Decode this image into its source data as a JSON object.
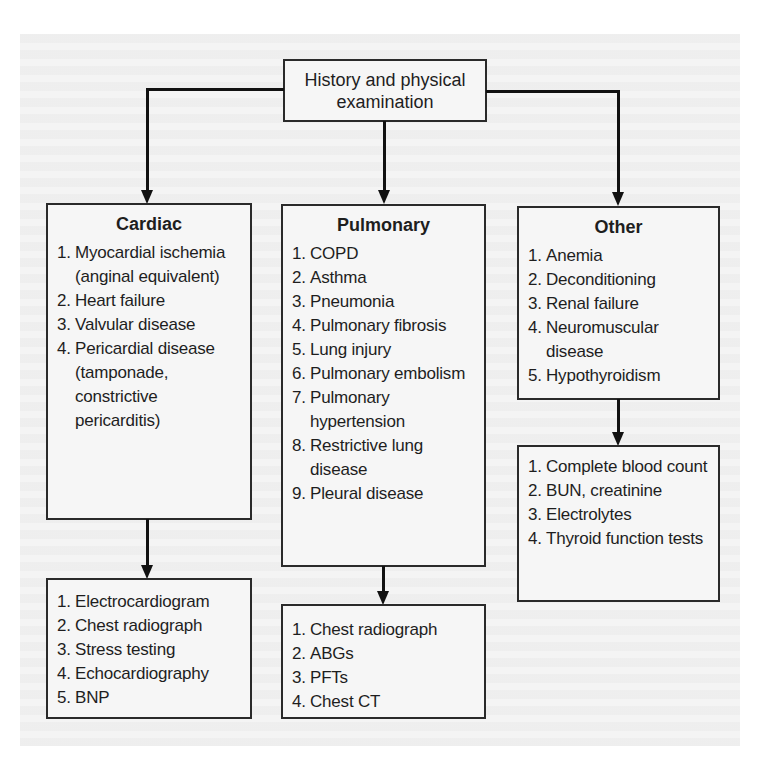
{
  "root": {
    "label_line1": "History and physical",
    "label_line2": "examination"
  },
  "branches": [
    {
      "title": "Cardiac",
      "causes": [
        {
          "n": "1.",
          "text": "Myocardial ischemia (anginal equivalent)"
        },
        {
          "n": "2.",
          "text": "Heart failure"
        },
        {
          "n": "3.",
          "text": "Valvular disease"
        },
        {
          "n": "4.",
          "text": "Pericardial disease (tamponade, constrictive pericarditis)"
        }
      ],
      "tests": [
        {
          "n": "1.",
          "text": "Electrocardiogram"
        },
        {
          "n": "2.",
          "text": "Chest radiograph"
        },
        {
          "n": "3.",
          "text": "Stress testing"
        },
        {
          "n": "4.",
          "text": "Echocardiography"
        },
        {
          "n": "5.",
          "text": "BNP"
        }
      ]
    },
    {
      "title": "Pulmonary",
      "causes": [
        {
          "n": "1.",
          "text": "COPD"
        },
        {
          "n": "2.",
          "text": "Asthma"
        },
        {
          "n": "3.",
          "text": "Pneumonia"
        },
        {
          "n": "4.",
          "text": "Pulmonary fibrosis"
        },
        {
          "n": "5.",
          "text": "Lung injury"
        },
        {
          "n": "6.",
          "text": "Pulmonary embolism"
        },
        {
          "n": "7.",
          "text": "Pulmonary hypertension"
        },
        {
          "n": "8.",
          "text": "Restrictive lung disease"
        },
        {
          "n": "9.",
          "text": "Pleural disease"
        }
      ],
      "tests": [
        {
          "n": "1.",
          "text": "Chest radiograph"
        },
        {
          "n": "2.",
          "text": "ABGs"
        },
        {
          "n": "3.",
          "text": "PFTs"
        },
        {
          "n": "4.",
          "text": "Chest CT"
        }
      ]
    },
    {
      "title": "Other",
      "causes": [
        {
          "n": "1.",
          "text": "Anemia"
        },
        {
          "n": "2.",
          "text": "Deconditioning"
        },
        {
          "n": "3.",
          "text": "Renal failure"
        },
        {
          "n": "4.",
          "text": "Neuromuscular disease"
        },
        {
          "n": "5.",
          "text": "Hypothyroidism"
        }
      ],
      "tests": [
        {
          "n": "1.",
          "text": "Complete blood count"
        },
        {
          "n": "2.",
          "text": "BUN, creatinine"
        },
        {
          "n": "3.",
          "text": "Electrolytes"
        },
        {
          "n": "4.",
          "text": "Thyroid function tests"
        }
      ]
    }
  ]
}
